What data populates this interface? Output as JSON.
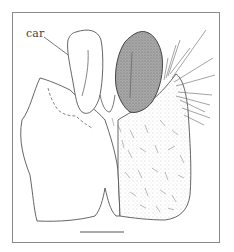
{
  "figure": {
    "labels": [
      {
        "text": "car",
        "x": 26,
        "y": 27
      }
    ],
    "scale_bar": {
      "x1": 80,
      "x2": 124,
      "y": 232
    },
    "colors": {
      "line": "#555555",
      "sclerite_fill": "#9a9a9a",
      "stipple_fill": "#eeeeee",
      "frame": "#8a8a8a"
    }
  }
}
